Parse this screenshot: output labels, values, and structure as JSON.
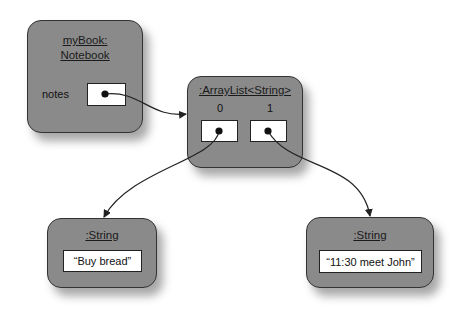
{
  "diagram": {
    "type": "object-diagram",
    "objects": [
      {
        "id": "notebook",
        "title_line1": "myBook:",
        "title_line2": "Notebook",
        "fields": [
          {
            "name": "notes",
            "kind": "reference"
          }
        ]
      },
      {
        "id": "arraylist",
        "title": ":ArrayList<String>",
        "slots": [
          {
            "index": "0",
            "kind": "reference"
          },
          {
            "index": "1",
            "kind": "reference"
          }
        ]
      },
      {
        "id": "string1",
        "title": ":String",
        "value": "“Buy bread”"
      },
      {
        "id": "string2",
        "title": ":String",
        "value": "“11:30 meet John”"
      }
    ],
    "references": [
      {
        "from": "notebook.notes",
        "to": "arraylist"
      },
      {
        "from": "arraylist.0",
        "to": "string1"
      },
      {
        "from": "arraylist.1",
        "to": "string2"
      }
    ],
    "colors": {
      "object_fill": "#8a8a8a",
      "object_border": "#333333",
      "field_fill": "#ffffff",
      "line": "#222222"
    }
  }
}
